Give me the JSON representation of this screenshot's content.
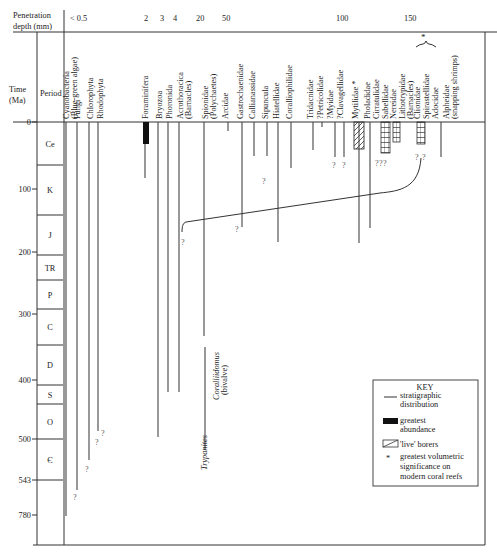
{
  "header": {
    "penetration_label_1": "Penetration",
    "penetration_label_2": "depth (mm)",
    "depth_ticks": [
      {
        "label": "< 0.5",
        "x": 70
      },
      {
        "label": "2",
        "x": 144
      },
      {
        "label": "3",
        "x": 160
      },
      {
        "label": "4",
        "x": 173
      },
      {
        "label": "20",
        "x": 196
      },
      {
        "label": "50",
        "x": 222
      },
      {
        "label": "100",
        "x": 336
      },
      {
        "label": "150",
        "x": 404
      }
    ],
    "time_label_1": "Time",
    "time_label_2": "(Ma)",
    "period_label": "Period"
  },
  "time_axis": [
    {
      "label": "0",
      "y": 122
    },
    {
      "label": "100",
      "y": 189
    },
    {
      "label": "200",
      "y": 252
    },
    {
      "label": "300",
      "y": 314
    },
    {
      "label": "400",
      "y": 380
    },
    {
      "label": "500",
      "y": 439
    },
    {
      "label": "543",
      "y": 480
    },
    {
      "label": "780",
      "y": 515
    }
  ],
  "periods": [
    {
      "label": "Ce",
      "y0": 122,
      "y1": 165
    },
    {
      "label": "K",
      "y0": 165,
      "y1": 215
    },
    {
      "label": "J",
      "y0": 215,
      "y1": 255
    },
    {
      "label": "TR",
      "y0": 255,
      "y1": 280
    },
    {
      "label": "P",
      "y0": 280,
      "y1": 309
    },
    {
      "label": "C",
      "y0": 309,
      "y1": 345
    },
    {
      "label": "D",
      "y0": 345,
      "y1": 385
    },
    {
      "label": "S",
      "y0": 385,
      "y1": 404
    },
    {
      "label": "O",
      "y0": 404,
      "y1": 439
    },
    {
      "label": "Є",
      "y0": 439,
      "y1": 480
    }
  ],
  "taxa": [
    {
      "lines": [
        "Cyanobacteria",
        "(Blue-green algae)"
      ],
      "x": 69
    },
    {
      "lines": [
        "Fungi"
      ],
      "x": 80
    },
    {
      "lines": [
        "Chlorophyta"
      ],
      "x": 93
    },
    {
      "lines": [
        "Rhodophyta"
      ],
      "x": 103
    },
    {
      "lines": [
        "Foraminifera"
      ],
      "x": 148
    },
    {
      "lines": [
        "Bryozoa"
      ],
      "x": 162
    },
    {
      "lines": [
        "Phoronida"
      ],
      "x": 172
    },
    {
      "lines": [
        "Acrothoracica",
        "(Barnacles)"
      ],
      "x": 183
    },
    {
      "lines": [
        "Spionidae",
        "(Polychaetes)"
      ],
      "x": 208
    },
    {
      "lines": [
        "Arcidae"
      ],
      "x": 228
    },
    {
      "lines": [
        "Gastrochaenidae"
      ],
      "x": 243
    },
    {
      "lines": [
        "Callianassidae"
      ],
      "x": 255
    },
    {
      "lines": [
        "Sipuncula"
      ],
      "x": 268
    },
    {
      "lines": [
        "Hiatellidae"
      ],
      "x": 279
    },
    {
      "lines": [
        "Coralliophilidae"
      ],
      "x": 292
    },
    {
      "lines": [
        "Tridacnidae"
      ],
      "x": 313
    },
    {
      "lines": [
        "?Petricolidae"
      ],
      "x": 323
    },
    {
      "lines": [
        "?Myidae"
      ],
      "x": 333
    },
    {
      "lines": [
        "?Clavagellidae"
      ],
      "x": 343
    },
    {
      "lines": [
        "Mytilidae *"
      ],
      "x": 358
    },
    {
      "lines": [
        "Pholadidae"
      ],
      "x": 370
    },
    {
      "lines": [
        "Cirratulidae"
      ],
      "x": 379
    },
    {
      "lines": [
        "Sabellidae"
      ],
      "x": 388
    },
    {
      "lines": [
        "Nereidae"
      ],
      "x": 396
    },
    {
      "lines": [
        "Lithotrypidae",
        "(Barnacles)"
      ],
      "x": 405
    },
    {
      "lines": [
        "Clionidae"
      ],
      "x": 420
    },
    {
      "lines": [
        "Spirastellidae"
      ],
      "x": 429
    },
    {
      "lines": [
        "Adocidae"
      ],
      "x": 438
    },
    {
      "lines": [
        "Alpheidae",
        "(snapping shrimps)"
      ],
      "x": 449
    }
  ],
  "ichnotaxa": [
    {
      "label": "Trypanites",
      "x": 207,
      "y": 470
    },
    {
      "label": "Coralliidomus",
      "x": 219,
      "y": 350,
      "sub": "(bivalve)"
    }
  ],
  "bracket_star": "*",
  "key": {
    "title": "KEY",
    "items": [
      {
        "symbol": "line",
        "label_1": "stratigraphic",
        "label_2": "distribution"
      },
      {
        "symbol": "black-bar",
        "label_1": "greatest",
        "label_2": "abundance"
      },
      {
        "symbol": "hatched-box",
        "label_1": "'live' borers",
        "label_2": ""
      },
      {
        "symbol": "asterisk",
        "label_1": "greatest volumetric",
        "label_2": "significance on",
        "label_3": "modern coral reefs"
      }
    ]
  },
  "question_mark": "?",
  "colors": {
    "line": "#333333",
    "fill_black": "#111111",
    "background": "#ffffff"
  }
}
